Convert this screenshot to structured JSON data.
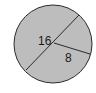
{
  "diagram": {
    "shape": "circle",
    "fill_color": "#bdbdbd",
    "stroke_color": "#2a2a2a",
    "diameter_label": "16",
    "radius_label": "8"
  }
}
